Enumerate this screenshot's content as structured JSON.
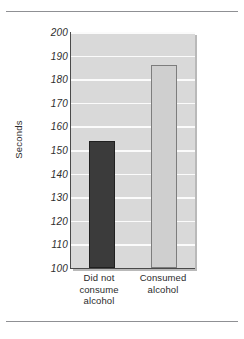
{
  "chart_data": {
    "type": "bar",
    "title": "",
    "xlabel": "",
    "ylabel": "Seconds",
    "categories": [
      "Did not consume alcohol",
      "Consumed alcohol"
    ],
    "category_lines": [
      [
        "Did not",
        "consume",
        "alcohol"
      ],
      [
        "Consumed",
        "alcohol"
      ]
    ],
    "values": [
      154,
      186
    ],
    "ylim": [
      100,
      200
    ],
    "ytick_step": 10,
    "yticks": [
      100,
      110,
      120,
      130,
      140,
      150,
      160,
      170,
      180,
      190,
      200
    ],
    "ytick_labels": [
      "100",
      "110",
      "120",
      "130",
      "140",
      "150",
      "160",
      "170",
      "180",
      "190",
      "200"
    ],
    "grid": true,
    "grid_orientation": "horizontal",
    "legend": false,
    "legend_position": "none",
    "bar_colors": [
      "#3b3b3b",
      "#cfcfcf"
    ],
    "plot_background": "#d9d9d9",
    "gridline_color": "#fbfbfb",
    "axis_color": "#4a4a4a"
  },
  "figure": {
    "y_axis_title": "Seconds"
  }
}
